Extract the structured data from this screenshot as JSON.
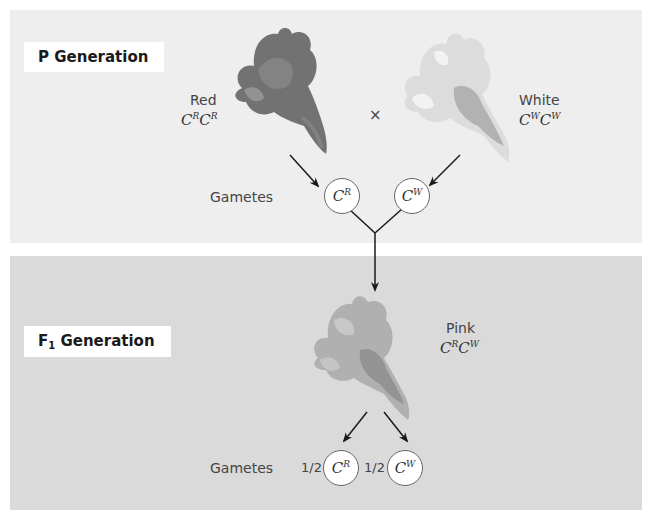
{
  "p_generation": {
    "label": "P Generation",
    "parent_red": {
      "phenotype": "Red",
      "allele1": "C",
      "sup1": "R",
      "allele2": "C",
      "sup2": "R",
      "color": "#6e6e6e"
    },
    "cross_symbol": "×",
    "parent_white": {
      "phenotype": "White",
      "allele1": "C",
      "sup1": "W",
      "allele2": "C",
      "sup2": "W",
      "color": "#d8d8d8"
    },
    "gametes_label": "Gametes",
    "gametes": [
      {
        "allele": "C",
        "sup": "R"
      },
      {
        "allele": "C",
        "sup": "W"
      }
    ]
  },
  "f1_generation": {
    "label_main": "F",
    "label_sub": "1",
    "label_rest": " Generation",
    "offspring": {
      "phenotype": "Pink",
      "allele1": "C",
      "sup1": "R",
      "allele2": "C",
      "sup2": "W",
      "color": "#a8a8a8"
    },
    "gametes_label": "Gametes",
    "gametes": [
      {
        "fraction": "1/2",
        "allele": "C",
        "sup": "R"
      },
      {
        "fraction": "1/2",
        "allele": "C",
        "sup": "W"
      }
    ]
  },
  "colors": {
    "panel_p_bg": "#eeeeee",
    "panel_f1_bg": "#dadada",
    "arrow": "#1a1a1a"
  }
}
